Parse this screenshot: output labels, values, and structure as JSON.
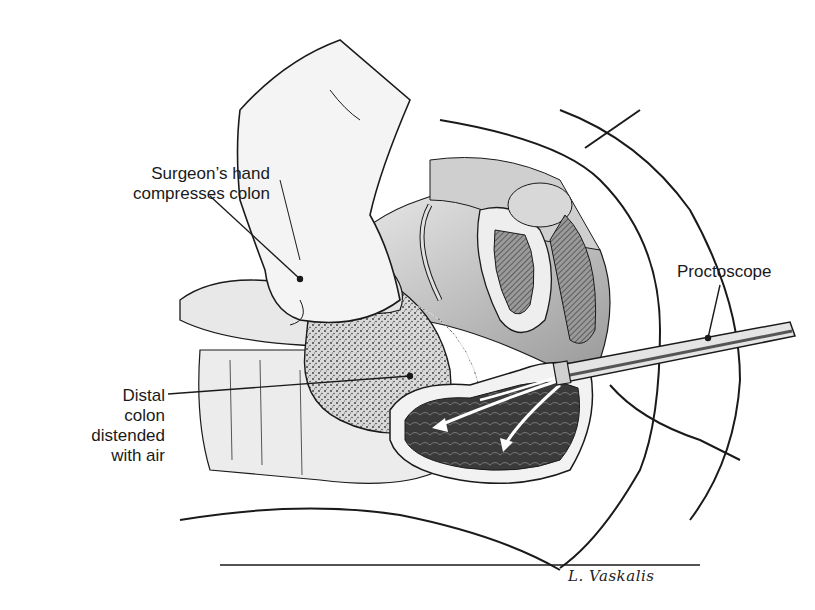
{
  "figure": {
    "type": "surgical illustration"
  },
  "labels": {
    "hand": [
      "Surgeon’s hand",
      "compresses colon"
    ],
    "colon": [
      "Distal",
      "colon",
      "distended",
      "with air"
    ],
    "proctoscope": [
      "Proctoscope"
    ]
  },
  "signature": "L. Vaskalis",
  "colors": {
    "ink": "#1a1a1a",
    "background": "#ffffff",
    "shade_light": "#e6e6e6",
    "shade_mid": "#b8b8b8",
    "shade_dark": "#555555"
  }
}
